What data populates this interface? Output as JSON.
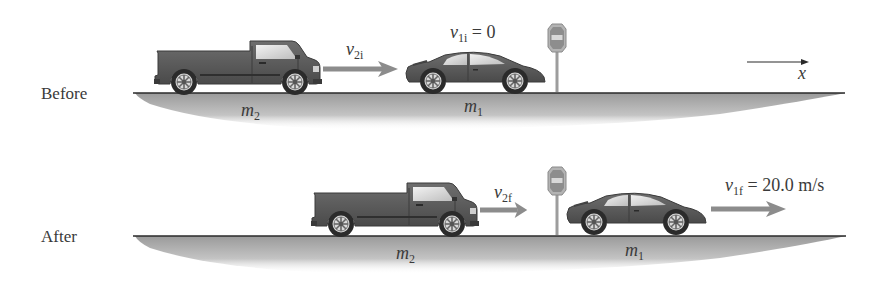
{
  "figure": {
    "type": "physics-collision-diagram",
    "colors": {
      "ground_shadow": "#a8a8a8",
      "ground_line": "#2a2a2a",
      "vehicle_body": "#5a5a5a",
      "arrow": "#8c8c8c",
      "text": "#3a3a3a"
    }
  },
  "before": {
    "label": "Before",
    "truck": {
      "mass_label": "m",
      "mass_sub": "2",
      "velocity_symbol": "v",
      "velocity_sub": "2i",
      "velocity_value": ""
    },
    "car": {
      "mass_label": "m",
      "mass_sub": "1",
      "velocity_symbol": "v",
      "velocity_sub": "1i",
      "velocity_eq": " = 0"
    },
    "stop_sign": "stop-sign",
    "axis": {
      "label": "x",
      "direction": "right"
    }
  },
  "after": {
    "label": "After",
    "truck": {
      "mass_label": "m",
      "mass_sub": "2",
      "velocity_symbol": "v",
      "velocity_sub": "2f"
    },
    "car": {
      "mass_label": "m",
      "mass_sub": "1",
      "velocity_symbol": "v",
      "velocity_sub": "1f",
      "velocity_eq": " = 20.0 m/s"
    },
    "stop_sign": "stop-sign"
  }
}
